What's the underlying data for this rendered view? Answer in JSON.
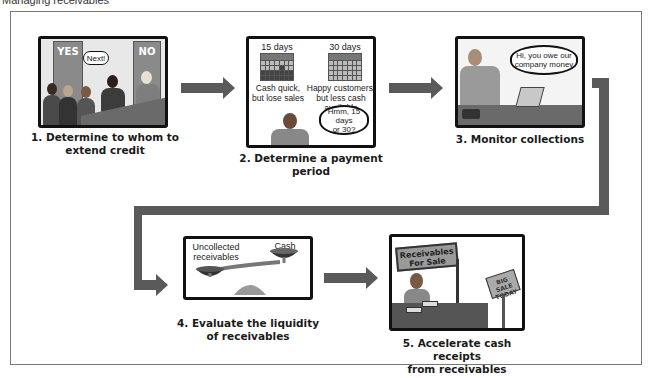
{
  "page_caption": "Managing receivables",
  "steps": [
    {
      "number": "1.",
      "caption_line1": "1. Determine to whom to",
      "caption_line2": "extend credit",
      "illustration": {
        "door_left_label": "YES",
        "door_right_label": "NO",
        "speech_bubble": "Next!"
      }
    },
    {
      "number": "2.",
      "caption_line1": "2. Determine a payment period",
      "illustration": {
        "option_a_title": "15 days",
        "option_a_note_line1": "Cash quick,",
        "option_a_note_line2": "but lose sales",
        "option_b_title": "30 days",
        "option_b_note_line1": "Happy customers,",
        "option_b_note_line2": "but less cash available",
        "speech_bubble_line1": "Hmm, 15 days",
        "speech_bubble_line2": "or 30?"
      }
    },
    {
      "number": "3.",
      "caption_line1": "3. Monitor collections",
      "illustration": {
        "speech_bubble_line1": "Hi,  you owe our",
        "speech_bubble_line2": "company money"
      }
    },
    {
      "number": "4.",
      "caption_line1": "4. Evaluate the liquidity",
      "caption_line2": "of receivables",
      "illustration": {
        "left_pan_label_line1": "Uncollected",
        "left_pan_label_line2": "receivables",
        "right_pan_label": "Cash"
      }
    },
    {
      "number": "5.",
      "caption_line1": "5. Accelerate cash receipts",
      "caption_line2": "from receivables",
      "illustration": {
        "booth_sign_line1": "Receivables",
        "booth_sign_line2": "For Sale",
        "side_sign_line1": "BIG SALE",
        "side_sign_line2": "TODAY"
      }
    }
  ],
  "colors": {
    "arrow": "#5a5a5a",
    "panel_border": "#111111",
    "frame_border": "#777777"
  }
}
